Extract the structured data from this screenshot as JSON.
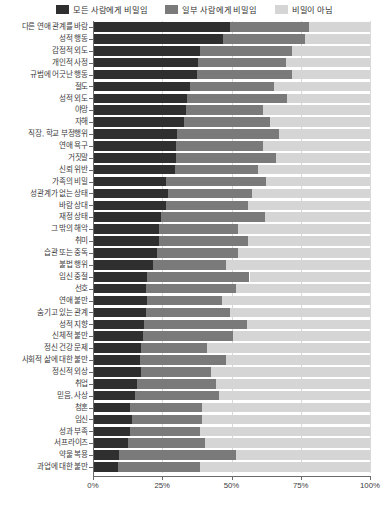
{
  "legend": {
    "position": "top",
    "items": [
      {
        "label": "모든 사람에게 비밀임",
        "color": "#2f2f2f",
        "name": "secret-from-everyone"
      },
      {
        "label": "일부 사람에게 비밀임",
        "color": "#7a7a7a",
        "name": "secret-from-some"
      },
      {
        "label": "비밀이 아님",
        "color": "#d5d5d5",
        "name": "not-secret"
      }
    ]
  },
  "axis": {
    "x_ticks": [
      "0%",
      "25%",
      "50%",
      "75%",
      "100%"
    ],
    "x_tick_values": [
      0,
      25,
      50,
      75,
      100
    ],
    "xlim": [
      0,
      100
    ]
  },
  "caption": "",
  "chart_data": {
    "type": "bar",
    "orientation": "horizontal",
    "stacked": true,
    "normalized_percent": true,
    "title": "",
    "xlabel": "",
    "ylabel": "",
    "xlim": [
      0,
      100
    ],
    "grid": true,
    "legend_position": "top",
    "series": [
      {
        "name": "모든 사람에게 비밀임",
        "color": "#2f2f2f"
      },
      {
        "name": "일부 사람에게 비밀임",
        "color": "#7a7a7a"
      },
      {
        "name": "비밀이 아님",
        "color": "#d5d5d5"
      }
    ],
    "categories": [
      "다른 연애 관계를 바람",
      "성적 행동",
      "감정적 외도",
      "개인적 사정",
      "규범에 어긋난 행동",
      "절도",
      "성적 외도",
      "야망",
      "자해",
      "직장, 학교 부정행위",
      "연애 욕구",
      "거짓말",
      "신뢰 위반",
      "가족의 비밀",
      "성관계가 없는 상태",
      "바람 상대",
      "재정 상태",
      "그 밖의 해악",
      "취미",
      "습관 또는 중독",
      "불법 행위",
      "임신 중절",
      "선호",
      "연애 불만",
      "숨기고 있는 관계",
      "성적 지향",
      "신체적 불만",
      "정신 건강 문제",
      "사회적 삶에 대한 불만",
      "정신적 외상",
      "취업",
      "믿음, 사상",
      "청혼",
      "임신",
      "성과 부족",
      "서프라이즈",
      "약물 복용",
      "과업에 대한 불만"
    ],
    "values": [
      [
        49.5,
        28.5,
        22.0
      ],
      [
        47.0,
        29.5,
        23.5
      ],
      [
        38.5,
        33.5,
        28.0
      ],
      [
        38.0,
        31.5,
        30.5
      ],
      [
        37.5,
        34.5,
        28.0
      ],
      [
        35.0,
        30.5,
        34.5
      ],
      [
        34.0,
        36.0,
        30.0
      ],
      [
        33.5,
        28.0,
        38.5
      ],
      [
        33.0,
        31.0,
        36.0
      ],
      [
        30.5,
        36.5,
        33.0
      ],
      [
        30.0,
        31.5,
        38.5
      ],
      [
        30.0,
        36.0,
        34.0
      ],
      [
        29.5,
        30.0,
        40.5
      ],
      [
        26.5,
        36.0,
        37.5
      ],
      [
        27.0,
        30.5,
        42.5
      ],
      [
        26.5,
        29.5,
        44.0
      ],
      [
        24.5,
        37.5,
        38.0
      ],
      [
        24.0,
        28.5,
        47.5
      ],
      [
        24.0,
        32.0,
        44.0
      ],
      [
        23.0,
        29.5,
        47.5
      ],
      [
        21.5,
        26.5,
        52.0
      ],
      [
        19.5,
        37.0,
        43.5
      ],
      [
        19.0,
        32.5,
        48.5
      ],
      [
        19.5,
        27.0,
        53.5
      ],
      [
        19.0,
        30.5,
        50.5
      ],
      [
        18.5,
        37.0,
        44.5
      ],
      [
        18.0,
        32.5,
        49.5
      ],
      [
        17.5,
        23.5,
        59.0
      ],
      [
        17.0,
        31.0,
        52.0
      ],
      [
        17.5,
        25.0,
        57.5
      ],
      [
        16.0,
        28.5,
        55.5
      ],
      [
        15.0,
        30.5,
        54.5
      ],
      [
        13.5,
        26.0,
        60.5
      ],
      [
        14.0,
        25.5,
        60.5
      ],
      [
        13.5,
        25.0,
        61.5
      ],
      [
        12.5,
        28.0,
        59.5
      ],
      [
        9.5,
        42.0,
        48.5
      ],
      [
        9.0,
        29.5,
        61.5
      ]
    ]
  }
}
